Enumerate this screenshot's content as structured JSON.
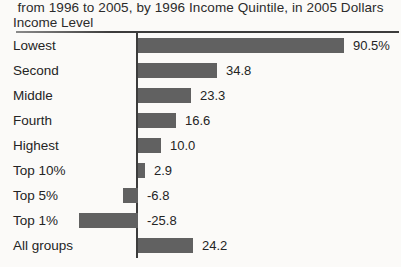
{
  "figure": {
    "title_line": "from 1996 to 2005, by 1996 Income Quintile, in 2005 Dollars",
    "axis_title": "Income Level"
  },
  "chart_data": {
    "type": "bar",
    "orientation": "horizontal",
    "title": "from 1996 to 2005, by 1996 Income Quintile, in 2005 Dollars",
    "ylabel": "Income Level",
    "xlabel": "",
    "xlim": [
      -30,
      95
    ],
    "grid": false,
    "legend": false,
    "bar_color": "#616161",
    "axis_color": "#3c3c3c",
    "categories": [
      "Lowest",
      "Second",
      "Middle",
      "Fourth",
      "Highest",
      "Top 10%",
      "Top 5%",
      "Top 1%",
      "All groups"
    ],
    "values": [
      90.5,
      34.8,
      23.3,
      16.6,
      10.0,
      2.9,
      -6.8,
      -25.8,
      24.2
    ],
    "value_labels": [
      "90.5%",
      "34.8",
      "23.3",
      "16.6",
      "10.0",
      "2.9",
      "-6.8",
      "-25.8",
      "24.2"
    ],
    "rows": [
      {
        "label": "Lowest",
        "value": 90.5,
        "display": "90.5%"
      },
      {
        "label": "Second",
        "value": 34.8,
        "display": "34.8"
      },
      {
        "label": "Middle",
        "value": 23.3,
        "display": "23.3"
      },
      {
        "label": "Fourth",
        "value": 16.6,
        "display": "16.6"
      },
      {
        "label": "Highest",
        "value": 10.0,
        "display": "10.0"
      },
      {
        "label": "Top 10%",
        "value": 2.9,
        "display": "2.9"
      },
      {
        "label": "Top 5%",
        "value": -6.8,
        "display": "-6.8"
      },
      {
        "label": "Top 1%",
        "value": -25.8,
        "display": "-25.8"
      },
      {
        "label": "All groups",
        "value": 24.2,
        "display": "24.2"
      }
    ]
  }
}
